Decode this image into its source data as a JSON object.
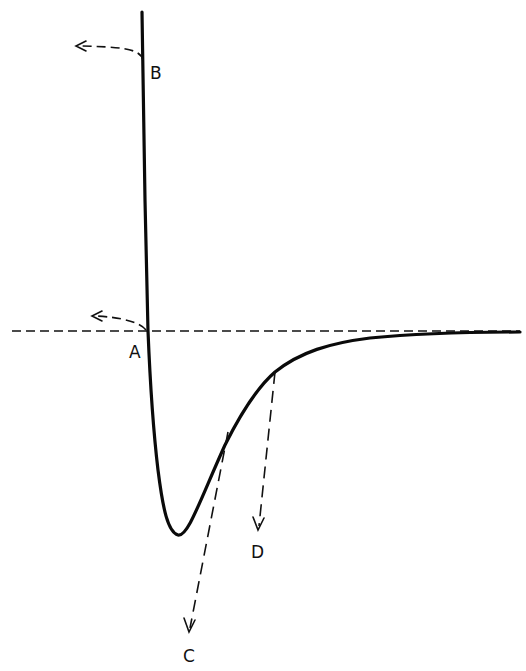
{
  "figure": {
    "labels": {
      "A": "A",
      "B": "B",
      "C": "C",
      "D": "D"
    },
    "colors": {
      "ink": "#111111",
      "background": "#ffffff"
    }
  }
}
